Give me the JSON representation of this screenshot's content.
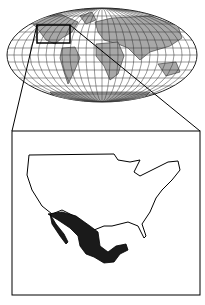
{
  "map": {
    "projection": "world-mollweide-locator",
    "highlight_region": "Mexico",
    "context_region": "United States",
    "colors": {
      "land": "#a8a8a8",
      "ocean": "#ffffff",
      "graticule": "#333333",
      "highlight": "#1a1a1a",
      "outline": "#000000"
    }
  }
}
